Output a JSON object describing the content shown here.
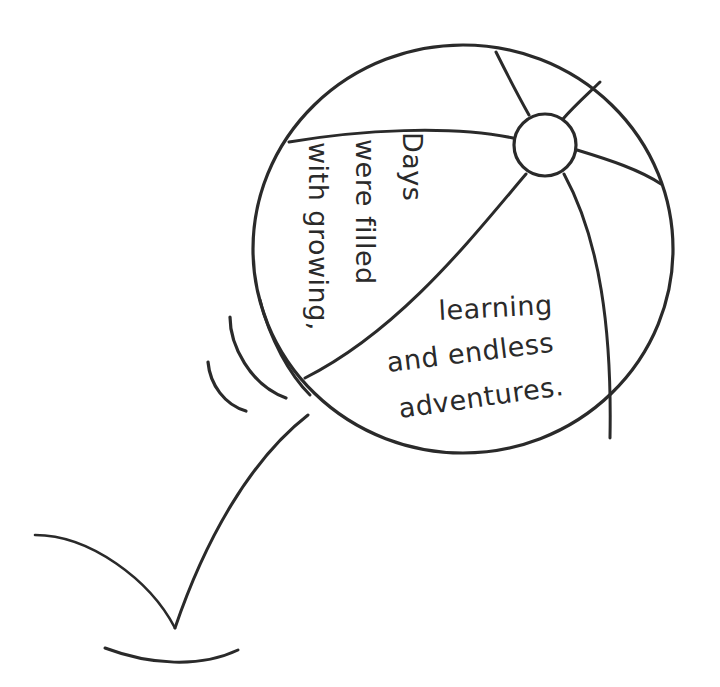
{
  "illustration": {
    "subject": "bouncing beach ball",
    "colors": {
      "ink": "#2a2a2a",
      "background": "#ffffff"
    },
    "ball_text_upper": [
      "Days",
      "were filled",
      "with growing,"
    ],
    "ball_text_lower": [
      "learning",
      "and endless",
      "adventures."
    ]
  }
}
